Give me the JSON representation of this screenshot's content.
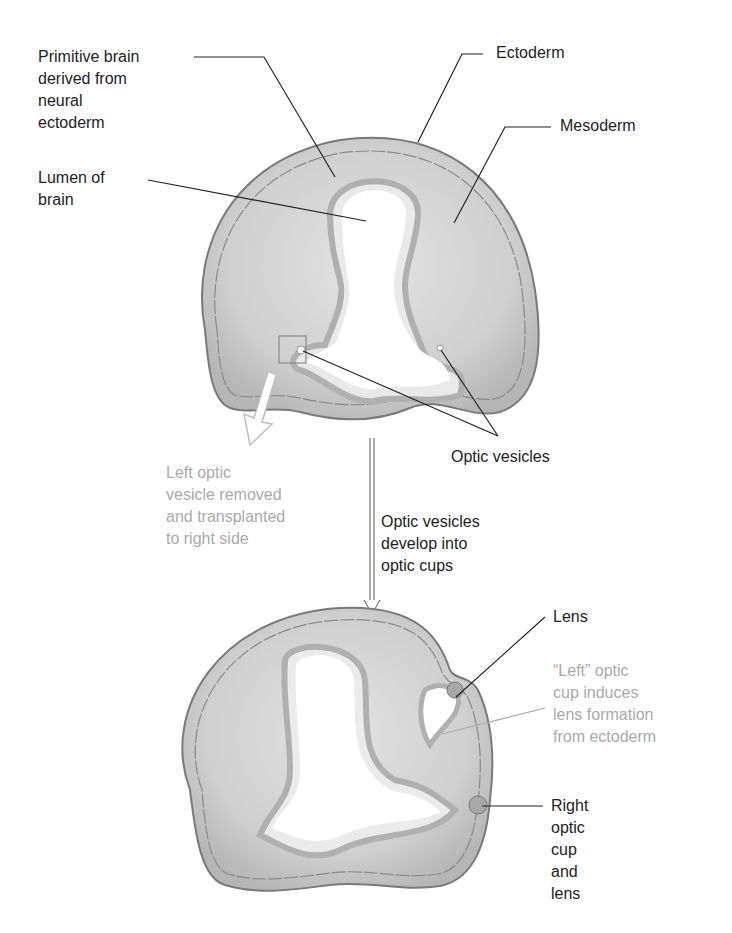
{
  "diagram": {
    "type": "embryology-schematic",
    "colors": {
      "tissue_fill": "#c9c9c9",
      "tissue_light": "#e2e2e2",
      "ectoderm": "#9a9a9a",
      "outline": "#7a7a7a",
      "leader_line": "#222222",
      "annotation_gray": "#a9a9a9",
      "text": "#222222"
    },
    "top_section": {
      "labels": {
        "primitive_brain": "Primitive brain\nderived from\nneural\nectoderm",
        "lumen": "Lumen of\nbrain",
        "ectoderm": "Ectoderm",
        "mesoderm": "Mesoderm",
        "optic_vesicles": "Optic vesicles",
        "left_removed": "Left optic\nvesicle removed\nand transplanted\nto right side"
      }
    },
    "transition": {
      "label": "Optic vesicles\ndevelop into\noptic cups",
      "arrow": "down-arrow-icon"
    },
    "bottom_section": {
      "labels": {
        "lens": "Lens",
        "left_cup": "“Left” optic\ncup induces\nlens formation\nfrom ectoderm",
        "right_cup": "Right\noptic\ncup\nand\nlens"
      }
    }
  }
}
